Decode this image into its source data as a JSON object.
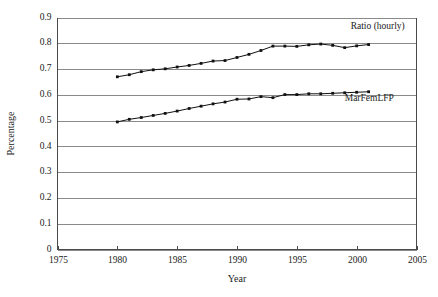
{
  "chart_data": {
    "type": "line",
    "title": "",
    "xlabel": "Year",
    "ylabel": "Percentage",
    "xlim": [
      1975,
      2005
    ],
    "ylim": [
      0,
      0.9
    ],
    "grid": true,
    "grid_orientation": "horizontal",
    "legend_position": "inline-right",
    "x_ticks": [
      1975,
      1980,
      1985,
      1990,
      1995,
      2000,
      2005
    ],
    "x_tick_labels": [
      "1975",
      "1980",
      "1985",
      "1990",
      "1995",
      "2000",
      "2005"
    ],
    "y_ticks": [
      0,
      0.1,
      0.2,
      0.3,
      0.4,
      0.5,
      0.6,
      0.7,
      0.8,
      0.9
    ],
    "y_tick_labels": [
      "0",
      "0.1",
      "0.2",
      "0.3",
      "0.4",
      "0.5",
      "0.6",
      "0.7",
      "0.8",
      "0.9"
    ],
    "x": [
      1980,
      1981,
      1982,
      1983,
      1984,
      1985,
      1986,
      1987,
      1988,
      1989,
      1990,
      1991,
      1992,
      1993,
      1994,
      1995,
      1996,
      1997,
      1998,
      1999,
      2000,
      2001
    ],
    "series": [
      {
        "name": "Ratio (hourly)",
        "color": "#111111",
        "marker": "square",
        "values": [
          0.67,
          0.678,
          0.69,
          0.697,
          0.701,
          0.708,
          0.714,
          0.722,
          0.731,
          0.733,
          0.745,
          0.757,
          0.772,
          0.789,
          0.789,
          0.788,
          0.794,
          0.797,
          0.792,
          0.783,
          0.79,
          0.795
        ],
        "label_text": "Ratio (hourly)"
      },
      {
        "name": "MarFemLFP",
        "color": "#111111",
        "marker": "square",
        "values": [
          0.495,
          0.505,
          0.512,
          0.52,
          0.528,
          0.537,
          0.547,
          0.556,
          0.565,
          0.572,
          0.583,
          0.584,
          0.593,
          0.589,
          0.601,
          0.601,
          0.604,
          0.604,
          0.606,
          0.608,
          0.61,
          0.612
        ],
        "label_text": "MarFemLFP"
      }
    ],
    "annotations": [
      {
        "text": "Ratio (hourly)",
        "x": 1999.5,
        "y": 0.855
      },
      {
        "text": "MarFemLFP",
        "x": 1999.0,
        "y": 0.575
      }
    ]
  }
}
